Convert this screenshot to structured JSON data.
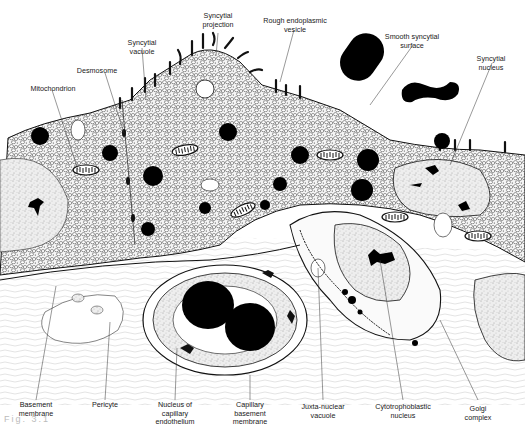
{
  "figure": {
    "caption_visible": "Fig. 3.1 ... (cut off, illegible)",
    "colors": {
      "ink": "#111111",
      "paper": "#ffffff",
      "cytoplasm_tint": "#f2f2f2",
      "nucleus_tint": "#e6e6e6"
    }
  },
  "labels": {
    "syncytial_projection": "Syncytial\nprojection",
    "rough_er_vesicle": "Rough endoplasmic\nvesicle",
    "syncytial_vacuole": "Syncytial\nvacuole",
    "desmosome": "Desmosome",
    "mitochondrion": "Mitochondrion",
    "smooth_syncytial_surface": "Smooth syncytial\nsurface",
    "syncytial_nucleus": "Syncytial\nnucleus",
    "basement_membrane": "Basement\nmembrane",
    "pericyte": "Pericyte",
    "nucleus_capillary_endothelium": "Nucleus of\ncapillary\nendothelium",
    "capillary_basement_membrane": "Capillary\nbasement\nmembrane",
    "juxta_nuclear_vacuole": "Juxta-nuclear\nvacuole",
    "cytotrophoblastic_nucleus": "Cytotrophoblastic\nnucleus",
    "golgi_complex": "Golgi\ncomplex"
  },
  "caption": "Fig. 3.1"
}
